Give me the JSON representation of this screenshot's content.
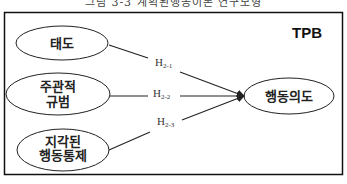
{
  "figure": {
    "caption": "그림 3-3 계획된행동이론 연구모형",
    "model_tag": "TPB",
    "frame_color": "#111111"
  },
  "nodes": {
    "attitude": {
      "label": "태도"
    },
    "subjective_norm": {
      "line1": "주관적",
      "line2": "규범"
    },
    "perceived_control": {
      "line1": "지각된",
      "line2": "행동통제"
    },
    "intention": {
      "label": "행동의도"
    }
  },
  "hypotheses": [
    {
      "main": "H",
      "sub": "2-1",
      "from": "태도",
      "to": "행동의도"
    },
    {
      "main": "H",
      "sub": "2-2",
      "from": "주관적 규범",
      "to": "행동의도"
    },
    {
      "main": "H",
      "sub": "2-3",
      "from": "지각된 행동통제",
      "to": "행동의도"
    }
  ]
}
